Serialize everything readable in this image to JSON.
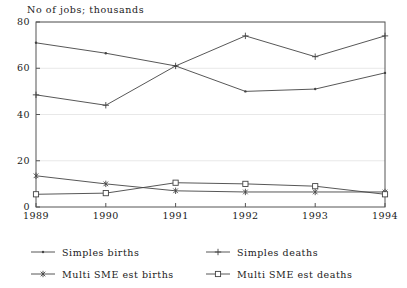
{
  "chart_data": {
    "type": "line",
    "title": "No of jobs; thousands",
    "xlabel": "",
    "ylabel": "",
    "x": [
      "1989",
      "1990",
      "1991",
      "1992",
      "1993",
      "1994"
    ],
    "xlim": [
      1989,
      1994
    ],
    "ylim": [
      0,
      80
    ],
    "yticks": [
      "0",
      "20",
      "40",
      "60",
      "80"
    ],
    "xticks": [
      "1989",
      "1990",
      "1991",
      "1992",
      "1993",
      "1994"
    ],
    "grid": true,
    "legend_position": "below",
    "series": [
      {
        "name": "Simples births",
        "marker": "dot-icon",
        "color": "#444444",
        "values": [
          71,
          66.5,
          61,
          50,
          51,
          58
        ]
      },
      {
        "name": "Simples deaths",
        "marker": "plus-icon",
        "color": "#444444",
        "values": [
          48.5,
          44,
          61,
          74,
          65,
          74
        ]
      },
      {
        "name": "Multi SME est births",
        "marker": "asterisk-icon",
        "color": "#444444",
        "values": [
          13.5,
          10,
          7,
          6.5,
          6.5,
          6.5
        ]
      },
      {
        "name": "Multi SME est deaths",
        "marker": "open-square-icon",
        "color": "#444444",
        "values": [
          5.5,
          6,
          10.5,
          10,
          9,
          5.5
        ]
      }
    ]
  },
  "colors": {
    "ink": "#1a1a1a",
    "line": "#444444",
    "frame": "#555555",
    "grid": "#e8e8e8",
    "background": "#ffffff"
  }
}
